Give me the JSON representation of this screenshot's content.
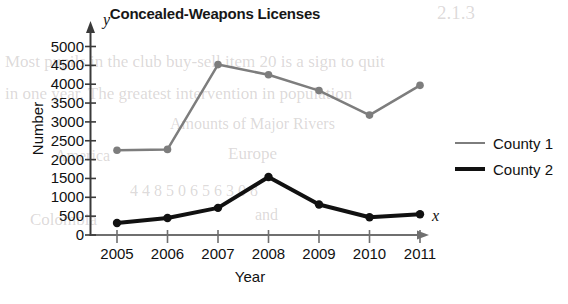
{
  "chart_data": {
    "type": "line",
    "title": "Concealed-Weapons Licenses",
    "xlabel": "Year",
    "ylabel": "Number",
    "x_axis_symbol": "x",
    "y_axis_symbol": "y",
    "categories": [
      "2005",
      "2006",
      "2007",
      "2008",
      "2009",
      "2010",
      "2011"
    ],
    "xlim": [
      2004.5,
      2011.6
    ],
    "ylim": [
      0,
      5200
    ],
    "yticks": [
      0,
      500,
      1000,
      1500,
      2000,
      2500,
      3000,
      3500,
      4000,
      4500,
      5000
    ],
    "ytick_labels": [
      "0",
      "500",
      "1000",
      "1500",
      "2000",
      "2500",
      "3000",
      "3500",
      "4000",
      "4500",
      "5000"
    ],
    "grid": false,
    "legend_position": "right",
    "series": [
      {
        "name": "County 1",
        "color": "#7d7d7d",
        "line_width": 2.5,
        "marker": "circle",
        "values": [
          2250,
          2270,
          4520,
          4250,
          3830,
          3180,
          3970
        ]
      },
      {
        "name": "County 2",
        "color": "#111111",
        "line_width": 4,
        "marker": "circle",
        "values": [
          320,
          450,
          720,
          1540,
          810,
          470,
          550
        ]
      }
    ]
  },
  "background_bleed": [
    {
      "text": "2.1.3",
      "x": 437,
      "y": 2,
      "size": 19
    },
    {
      "text": "Most pupils in the club buy-sell item 20 is a sign to quit",
      "x": 5,
      "y": 52,
      "size": 17
    },
    {
      "text": "in one year. The greatest intervention in population",
      "x": 5,
      "y": 84,
      "size": 17
    },
    {
      "text": "Amounts of Major Rivers",
      "x": 170,
      "y": 115,
      "size": 16
    },
    {
      "text": "America",
      "x": 55,
      "y": 147,
      "size": 16
    },
    {
      "text": "Europe",
      "x": 228,
      "y": 144,
      "size": 17
    },
    {
      "text": "4 4 8 5 0 6 5 6 3 0 8",
      "x": 130,
      "y": 182,
      "size": 16
    },
    {
      "text": "Colombia",
      "x": 30,
      "y": 210,
      "size": 17
    },
    {
      "text": "and",
      "x": 255,
      "y": 206,
      "size": 16
    }
  ]
}
